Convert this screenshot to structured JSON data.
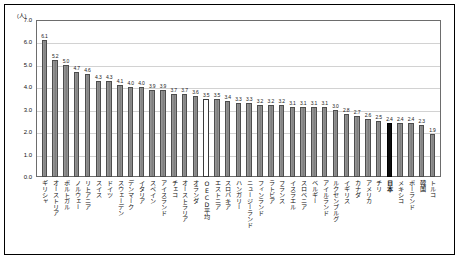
{
  "chart_data": {
    "type": "bar",
    "title": "",
    "subtitle": "",
    "xlabel": "",
    "ylabel": "",
    "yunit": "(人)",
    "ylim": [
      0.0,
      7.0
    ],
    "ytick_labels": [
      "7.0",
      "6.0",
      "5.0",
      "4.0",
      "3.0",
      "2.0",
      "1.0",
      "0.0"
    ],
    "ytick_values": [
      7.0,
      6.0,
      5.0,
      4.0,
      3.0,
      2.0,
      1.0,
      0.0
    ],
    "grid": true,
    "legend": "none",
    "categories": [
      "ギリシャ",
      "オーストリア",
      "ポルトガル",
      "ノルウェー",
      "リトアニア",
      "スイス",
      "ドイツ",
      "スウェーデン",
      "デンマーク",
      "イタリア",
      "スペイン",
      "アイスランド",
      "チェコ",
      "オーストラリア",
      "オランダ",
      "OECD平均",
      "エストニア",
      "スロバキア",
      "ハンガリー",
      "ニュージーランド",
      "フィンランド",
      "ラトビア",
      "フランス",
      "イスラエル",
      "スロベニア",
      "ベルギー",
      "アイルランド",
      "ルクセンブルグ",
      "イギリス",
      "カナダ",
      "アメリカ",
      "チリ",
      "日本",
      "メキシコ",
      "ポーランド",
      "韓国",
      "トルコ"
    ],
    "values": [
      6.1,
      5.2,
      5.0,
      4.7,
      4.6,
      4.3,
      4.3,
      4.1,
      4.0,
      4.0,
      3.9,
      3.9,
      3.7,
      3.7,
      3.6,
      3.5,
      3.5,
      3.4,
      3.3,
      3.3,
      3.2,
      3.2,
      3.2,
      3.1,
      3.1,
      3.1,
      3.1,
      3.0,
      2.8,
      2.7,
      2.6,
      2.5,
      2.4,
      2.4,
      2.4,
      2.3,
      1.9
    ],
    "value_labels": [
      "6.1",
      "5.2",
      "5.0",
      "4.7",
      "4.6",
      "4.3",
      "4.3",
      "4.1",
      "4.0",
      "4.0",
      "3.9",
      "3.9",
      "3.7",
      "3.7",
      "3.6",
      "3.5",
      "3.5",
      "3.4",
      "3.3",
      "3.3",
      "3.2",
      "3.2",
      "3.2",
      "3.1",
      "3.1",
      "3.1",
      "3.1",
      "3.0",
      "2.8",
      "2.7",
      "2.6",
      "2.5",
      "2.4",
      "2.4",
      "2.4",
      "2.3",
      "1.9"
    ],
    "highlight": {
      "hollow_index": 15,
      "hollow_label": "OECD平均",
      "dark_index": 32,
      "dark_label": "日本"
    },
    "colors": {
      "bar_fill": "#8b8b8b",
      "bar_border": "#4d4d4d",
      "bar_hollow_fill": "#ffffff",
      "bar_dark_fill": "#0d0d0d",
      "gridline": "#d2d2d2",
      "axis": "#6d6d6d",
      "frame": "#000000",
      "text": "#111111",
      "background": "#ffffff"
    }
  }
}
